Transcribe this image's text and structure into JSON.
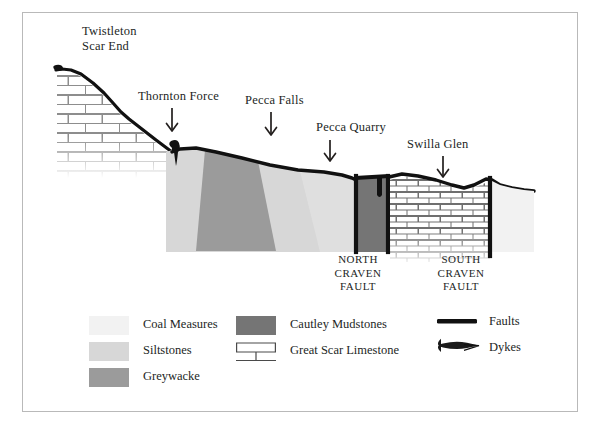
{
  "figure": {
    "type": "geological-cross-section",
    "title_visible": false,
    "border_color": "#b9b9b9",
    "background": "#ffffff"
  },
  "annotations": [
    {
      "id": "twistleton-scar-end",
      "label": "Twistleton\nScar End",
      "has_arrow": false,
      "x": 82,
      "y": 26
    },
    {
      "id": "thornton-force",
      "label": "Thornton Force",
      "has_arrow": true,
      "x": 138,
      "y": 90,
      "arrow_x": 172,
      "arrow_y": 108,
      "arrow_len": 26
    },
    {
      "id": "pecca-falls",
      "label": "Pecca Falls",
      "has_arrow": true,
      "x": 246,
      "y": 94,
      "arrow_x": 271,
      "arrow_y": 112,
      "arrow_len": 26
    },
    {
      "id": "pecca-quarry",
      "label": "Pecca Quarry",
      "has_arrow": true,
      "x": 318,
      "y": 120,
      "arrow_x": 330,
      "arrow_y": 138,
      "arrow_len": 26
    },
    {
      "id": "swilla-glen",
      "label": "Swilla Glen",
      "has_arrow": true,
      "x": 408,
      "y": 137,
      "arrow_x": 443,
      "arrow_y": 155,
      "arrow_len": 26
    }
  ],
  "faults": [
    {
      "id": "north-craven-fault",
      "label": "NORTH\nCRAVEN\nFAULT",
      "x": 357,
      "y": 254
    },
    {
      "id": "south-craven-fault",
      "label": "SOUTH\nCRAVEN\nFAULT",
      "x": 458,
      "y": 254
    }
  ],
  "legend": {
    "columns": [
      {
        "id": "legend-col-1",
        "items": [
          {
            "id": "coal-measures",
            "label": "Coal Measures",
            "swatch": "fill",
            "color": "#f2f2f2"
          },
          {
            "id": "siltstones",
            "label": "Siltstones",
            "swatch": "fill",
            "color": "#d7d7d7"
          },
          {
            "id": "greywacke",
            "label": "Greywacke",
            "swatch": "fill",
            "color": "#9b9b9b"
          }
        ]
      },
      {
        "id": "legend-col-2",
        "items": [
          {
            "id": "cautley-mudstones",
            "label": "Cautley Mudstones",
            "swatch": "fill",
            "color": "#757575"
          },
          {
            "id": "great-scar-limestone",
            "label": "Great Scar Limestone",
            "swatch": "brick",
            "color": "#ffffff"
          }
        ]
      },
      {
        "id": "legend-col-3",
        "items": [
          {
            "id": "faults",
            "label": "Faults",
            "swatch": "line",
            "color": "#111111"
          },
          {
            "id": "dykes",
            "label": "Dykes",
            "swatch": "dyke",
            "color": "#111111"
          }
        ]
      }
    ]
  },
  "units": {
    "coal_measures_color": "#f2f2f2",
    "siltstones_color": "#d7d7d7",
    "greywacke_color": "#9b9b9b",
    "cautley_mudstones_color": "#757575",
    "limestone_color": "#ffffff",
    "limestone_line_color": "#8d8d8d",
    "outline_color": "#111111"
  }
}
